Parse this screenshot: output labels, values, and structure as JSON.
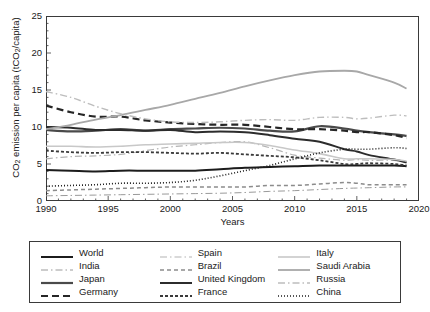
{
  "chart_data": {
    "type": "line",
    "title": "",
    "xlabel": "Years",
    "ylabel": "CO2 emission per capita (tCO2/capita)",
    "ylabel_parts": {
      "pre": "CO",
      "sub1": "2",
      "mid": " emission per capita (tCO",
      "sub2": "2",
      "post": "/capita)"
    },
    "xlim": [
      1990,
      2020
    ],
    "ylim": [
      0,
      25
    ],
    "yticks": [
      0,
      5,
      10,
      15,
      20,
      25
    ],
    "xticks": [
      1990,
      1995,
      2000,
      2005,
      2010,
      2015,
      2020
    ],
    "xminor_step": 1,
    "yminor_step": 1,
    "grid": false,
    "legend_position": "below-plot",
    "legend_columns": 3,
    "x": [
      1990,
      1992,
      1994,
      1996,
      1998,
      2000,
      2002,
      2004,
      2006,
      2008,
      2010,
      2012,
      2014,
      2015,
      2016,
      2018,
      2019
    ],
    "series": [
      {
        "name": "World",
        "color": "#1c1c1c",
        "width": 2.0,
        "dash": "none",
        "values": [
          4.2,
          4.1,
          4.0,
          4.1,
          4.1,
          4.1,
          4.1,
          4.3,
          4.5,
          4.6,
          4.7,
          4.8,
          4.8,
          4.8,
          4.8,
          4.8,
          4.7
        ]
      },
      {
        "name": "India",
        "color": "#9a9a9a",
        "width": 1.0,
        "dash": "dashdot-long",
        "values": [
          0.7,
          0.75,
          0.8,
          0.85,
          0.9,
          0.95,
          1.0,
          1.05,
          1.15,
          1.3,
          1.4,
          1.55,
          1.7,
          1.75,
          1.8,
          1.9,
          1.9
        ]
      },
      {
        "name": "Japan",
        "color": "#4a4a4a",
        "width": 2.2,
        "dash": "none",
        "values": [
          9.6,
          9.4,
          9.5,
          9.7,
          9.5,
          9.7,
          9.8,
          9.9,
          9.8,
          9.5,
          9.4,
          10.1,
          9.8,
          9.5,
          9.3,
          9.0,
          8.8
        ]
      },
      {
        "name": "Germany",
        "color": "#262626",
        "width": 2.2,
        "dash": "dash-long",
        "values": [
          12.9,
          12.0,
          11.4,
          11.4,
          10.9,
          10.6,
          10.4,
          10.3,
          10.3,
          10.0,
          9.7,
          9.7,
          9.5,
          9.3,
          9.3,
          8.9,
          8.5
        ]
      },
      {
        "name": "Spain",
        "color": "#b4b4b4",
        "width": 1.2,
        "dash": "dashdot-long",
        "values": [
          5.7,
          6.0,
          6.1,
          6.3,
          6.8,
          7.3,
          7.6,
          7.9,
          8.0,
          7.2,
          6.2,
          5.8,
          5.5,
          5.6,
          5.5,
          5.5,
          5.2
        ]
      },
      {
        "name": "Brazil",
        "color": "#8c8c8c",
        "width": 1.5,
        "dash": "dash-med",
        "values": [
          1.4,
          1.5,
          1.6,
          1.7,
          1.8,
          1.9,
          1.9,
          1.9,
          1.9,
          2.1,
          2.1,
          2.3,
          2.5,
          2.4,
          2.2,
          2.2,
          2.2
        ]
      },
      {
        "name": "United Kingdom",
        "color": "#2c2c2c",
        "width": 2.0,
        "dash": "none",
        "values": [
          10.0,
          9.9,
          9.6,
          9.6,
          9.5,
          9.6,
          9.3,
          9.4,
          9.3,
          8.9,
          8.4,
          8.0,
          7.0,
          6.7,
          6.2,
          5.6,
          5.2
        ]
      },
      {
        "name": "France",
        "color": "#3a3a3a",
        "width": 1.8,
        "dash": "dash-short",
        "values": [
          6.8,
          6.6,
          6.5,
          6.6,
          6.6,
          6.5,
          6.4,
          6.5,
          6.3,
          6.1,
          5.9,
          5.5,
          5.0,
          5.0,
          5.1,
          5.0,
          4.8
        ]
      },
      {
        "name": "Italy",
        "color": "#c8c8c8",
        "width": 1.6,
        "dash": "none",
        "values": [
          7.4,
          7.4,
          7.3,
          7.4,
          7.6,
          7.7,
          7.8,
          7.9,
          7.9,
          7.5,
          6.9,
          6.4,
          5.7,
          5.7,
          5.7,
          5.6,
          5.4
        ]
      },
      {
        "name": "Saudi Arabia",
        "color": "#a8a8a8",
        "width": 1.8,
        "dash": "none",
        "values": [
          9.7,
          10.3,
          11.0,
          11.6,
          12.3,
          13.0,
          13.8,
          14.6,
          15.5,
          16.3,
          17.0,
          17.5,
          17.6,
          17.5,
          17.0,
          16.0,
          15.2
        ]
      },
      {
        "name": "Russia",
        "color": "#bdbdbd",
        "width": 1.4,
        "dash": "dashdot-long",
        "values": [
          14.8,
          14.0,
          12.8,
          11.8,
          11.1,
          10.7,
          10.6,
          10.7,
          10.9,
          11.0,
          10.9,
          11.3,
          11.3,
          11.1,
          11.2,
          11.6,
          11.5
        ]
      },
      {
        "name": "China",
        "color": "#1f1f1f",
        "width": 1.6,
        "dash": "dot",
        "values": [
          2.0,
          2.1,
          2.2,
          2.4,
          2.4,
          2.5,
          2.8,
          3.4,
          4.1,
          4.8,
          5.7,
          6.5,
          7.0,
          7.0,
          7.0,
          7.2,
          7.1
        ]
      }
    ]
  },
  "legend": {
    "columns": [
      {
        "items": [
          "World",
          "India",
          "Japan",
          "Germany"
        ]
      },
      {
        "items": [
          "Spain",
          "Brazil",
          "United Kingdom",
          "France"
        ]
      },
      {
        "items": [
          "Italy",
          "Saudi Arabia",
          "Russia",
          "China"
        ]
      }
    ]
  }
}
